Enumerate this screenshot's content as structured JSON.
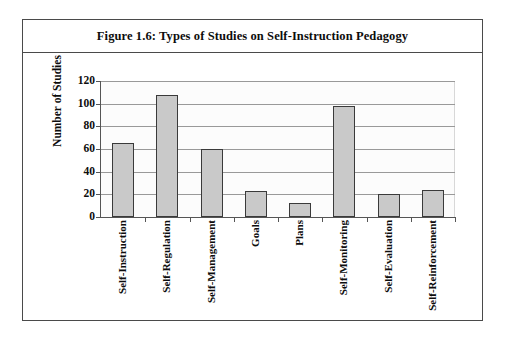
{
  "figure": {
    "title": "Figure 1.6: Types of Studies on Self-Instruction Pedagogy"
  },
  "chart_data": {
    "type": "bar",
    "title": "Figure 1.6: Types of Studies on Self-Instruction Pedagogy",
    "xlabel": "",
    "ylabel": "Number of Studies",
    "ylim": [
      0,
      120
    ],
    "yticks": [
      0,
      20,
      40,
      60,
      80,
      100,
      120
    ],
    "ytick_labels": [
      "0",
      "20",
      "40",
      "60",
      "80",
      "100",
      "120"
    ],
    "grid": true,
    "legend": null,
    "bar_color": "#c9c9c9",
    "bar_edge_color": "#3a3a3a",
    "categories": [
      "Self-Instruction",
      "Self-Regulation",
      "Self-Management",
      "Goals",
      "Plans",
      "Self-Monitoring",
      "Self-Evaluation",
      "Self-Reinforcement"
    ],
    "values": [
      65,
      108,
      60,
      23,
      12,
      98,
      20,
      24
    ]
  }
}
